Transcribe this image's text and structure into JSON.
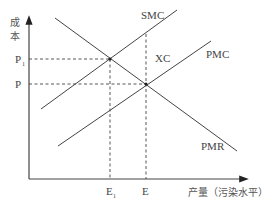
{
  "diagram": {
    "y_axis_label": [
      "成",
      "本"
    ],
    "x_axis_label": "产量（污染水平）",
    "curves": {
      "smc": "SMC",
      "pmc": "PMC",
      "pmr": "PMR",
      "xc": "XC"
    },
    "y_ticks": {
      "p1": "P",
      "p1_sub": "1",
      "p": "P"
    },
    "x_ticks": {
      "e1": "E",
      "e1_sub": "1",
      "e": "E"
    },
    "colors": {
      "line": "#444444",
      "text": "#444444"
    }
  }
}
